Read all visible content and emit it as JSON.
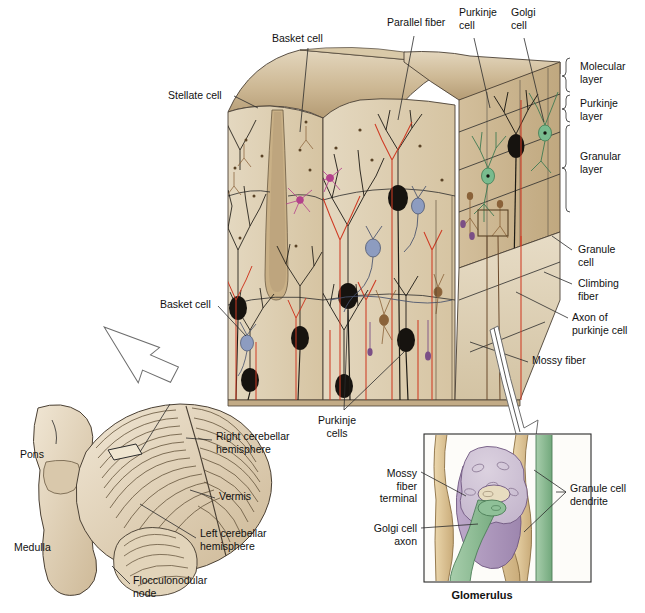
{
  "figure": {
    "palette": {
      "tissue_light": "#ded0b4",
      "tissue_mid": "#cdb894",
      "tissue_dark": "#b9a078",
      "purkinje_black": "#16130f",
      "climbing_fiber_red": "#cf3b24",
      "basket_blue": "#8d9cc0",
      "stellate_magenta": "#b4418c",
      "golgi_green": "#79bb8e",
      "granule_brown": "#8a6239",
      "mossy_terminal_violet": "#b29bc2",
      "glomerulus_body": "#cfc3d4",
      "golgi_axon_green": "#86b88f",
      "dendrite_tan": "#ddc394",
      "brainstem": "#e6d9c3",
      "leader": "#2b2b2b"
    },
    "labels_main": [
      {
        "id": "stellate-cell",
        "text": "Stellate cell",
        "x": 168,
        "y": 95,
        "align": "left"
      },
      {
        "id": "basket-cell-top",
        "text": "Basket cell",
        "x": 272,
        "y": 38,
        "align": "left"
      },
      {
        "id": "parallel-fiber",
        "text": "Parallel fiber",
        "x": 387,
        "y": 22,
        "align": "left"
      },
      {
        "id": "purkinje-cell-top",
        "text": "Purkinje\ncell",
        "x": 459,
        "y": 12,
        "align": "left"
      },
      {
        "id": "golgi-cell-top",
        "text": "Golgi\ncell",
        "x": 511,
        "y": 12,
        "align": "left"
      },
      {
        "id": "basket-cell-left",
        "text": "Basket cell",
        "x": 160,
        "y": 303,
        "align": "left"
      },
      {
        "id": "purkinje-cells-bottom",
        "text": "Purkinje\ncells",
        "x": 337,
        "y": 415,
        "align": "center"
      }
    ],
    "labels_right": [
      {
        "id": "molecular-layer",
        "text": "Molecular\nlayer",
        "x": 580,
        "y": 66
      },
      {
        "id": "purkinje-layer",
        "text": "Purkinje\nlayer",
        "x": 580,
        "y": 103
      },
      {
        "id": "granular-layer",
        "text": "Granular\nlayer",
        "x": 580,
        "y": 152
      },
      {
        "id": "granule-cell",
        "text": "Granule\ncell",
        "x": 578,
        "y": 247
      },
      {
        "id": "climbing-fiber",
        "text": "Climbing\nfiber",
        "x": 578,
        "y": 281
      },
      {
        "id": "axon-of-purkinje-cell",
        "text": "Axon of\npurkinje cell",
        "x": 572,
        "y": 315
      },
      {
        "id": "mossy-fiber",
        "text": "Mossy fiber",
        "x": 532,
        "y": 358
      }
    ],
    "brackets": [
      {
        "id": "bracket-molecular",
        "y1": 58,
        "y2": 92
      },
      {
        "id": "bracket-purkinje",
        "y1": 95,
        "y2": 122
      },
      {
        "id": "bracket-granular",
        "y1": 125,
        "y2": 212
      }
    ],
    "cerebellum_labels": [
      {
        "id": "pons",
        "text": "Pons",
        "x": 20,
        "y": 452,
        "align": "left"
      },
      {
        "id": "medulla",
        "text": "Medulla",
        "x": 14,
        "y": 545,
        "align": "left"
      },
      {
        "id": "right-cerebellar-hemisphere",
        "text": "Right cerebellar\nhemisphere",
        "x": 216,
        "y": 435,
        "align": "left"
      },
      {
        "id": "vermis",
        "text": "Vermis",
        "x": 219,
        "y": 494,
        "align": "left"
      },
      {
        "id": "left-cerebellar-hemisphere",
        "text": "Left cerebellar\nhemisphere",
        "x": 200,
        "y": 531,
        "align": "left"
      },
      {
        "id": "flocculonodular-node",
        "text": "Flocculonodular\nnode",
        "x": 133,
        "y": 578,
        "align": "left"
      }
    ],
    "glomerulus": {
      "caption": "Glomerulus",
      "caption_x": 482,
      "caption_y": 594,
      "frame": {
        "x": 424,
        "y": 434,
        "w": 167,
        "h": 148
      },
      "labels": [
        {
          "id": "mossy-fiber-terminal",
          "text": "Mossy\nfiber\nterminal",
          "x": 417,
          "y": 473,
          "align": "right"
        },
        {
          "id": "golgi-cell-axon",
          "text": "Golgi cell\naxon",
          "x": 417,
          "y": 528,
          "align": "right"
        },
        {
          "id": "granule-cell-dendrite",
          "text": "Granule cell\ndendrite",
          "x": 570,
          "y": 488,
          "align": "left"
        }
      ]
    }
  }
}
